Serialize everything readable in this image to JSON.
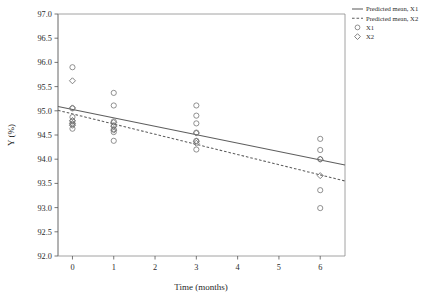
{
  "chart_data": {
    "type": "scatter",
    "title": "",
    "xlabel": "Time (months)",
    "ylabel": "Y (%)",
    "xlim": [
      -0.35,
      6.6
    ],
    "ylim": [
      92.0,
      97.0
    ],
    "grid": false,
    "xticks": [
      0,
      1,
      2,
      3,
      4,
      5,
      6
    ],
    "xtick_labels": [
      "0",
      "1",
      "2",
      "3",
      "4",
      "5",
      "6"
    ],
    "yticks": [
      92.0,
      92.5,
      93.0,
      93.5,
      94.0,
      94.5,
      95.0,
      95.5,
      96.0,
      96.5,
      97.0
    ],
    "ytick_labels": [
      "92.0",
      "92.5",
      "93.0",
      "93.5",
      "94.0",
      "94.5",
      "95.0",
      "95.5",
      "96.0",
      "96.5",
      "97.0"
    ],
    "legend_position": "outside-top-right",
    "legend": [
      {
        "key": "pred-mean-x1",
        "label": "Predicted mean, X1",
        "marker": "line-solid"
      },
      {
        "key": "pred-mean-x2",
        "label": "Predicted mean, X2",
        "marker": "line-dashed"
      },
      {
        "key": "obs-x1",
        "label": "X1",
        "marker": "circle"
      },
      {
        "key": "obs-x2",
        "label": "X2",
        "marker": "diamond"
      }
    ],
    "series": [
      {
        "name": "Predicted mean, X1",
        "type": "line",
        "style": "solid",
        "x": [
          -0.35,
          6.6
        ],
        "values": [
          95.09,
          93.88
        ]
      },
      {
        "name": "Predicted mean, X2",
        "type": "line",
        "style": "dashed",
        "x": [
          -0.35,
          6.6
        ],
        "values": [
          95.01,
          93.55
        ]
      },
      {
        "name": "X1",
        "type": "scatter",
        "marker": "circle",
        "points": [
          {
            "x": 0,
            "y": 95.9
          },
          {
            "x": 0,
            "y": 95.05
          },
          {
            "x": 0,
            "y": 94.87
          },
          {
            "x": 0,
            "y": 94.78
          },
          {
            "x": 0,
            "y": 94.72
          },
          {
            "x": 0,
            "y": 94.63
          },
          {
            "x": 1,
            "y": 95.37
          },
          {
            "x": 1,
            "y": 95.11
          },
          {
            "x": 1,
            "y": 94.78
          },
          {
            "x": 1,
            "y": 94.7
          },
          {
            "x": 1,
            "y": 94.62
          },
          {
            "x": 1,
            "y": 94.56
          },
          {
            "x": 1,
            "y": 94.38
          },
          {
            "x": 3,
            "y": 95.11
          },
          {
            "x": 3,
            "y": 94.9
          },
          {
            "x": 3,
            "y": 94.74
          },
          {
            "x": 3,
            "y": 94.55
          },
          {
            "x": 3,
            "y": 94.38
          },
          {
            "x": 3,
            "y": 94.2
          },
          {
            "x": 6,
            "y": 94.42
          },
          {
            "x": 6,
            "y": 94.19
          },
          {
            "x": 6,
            "y": 94.0
          },
          {
            "x": 6,
            "y": 93.36
          },
          {
            "x": 6,
            "y": 92.99
          }
        ]
      },
      {
        "name": "X2",
        "type": "scatter",
        "marker": "diamond",
        "points": [
          {
            "x": 0,
            "y": 95.62
          },
          {
            "x": 0,
            "y": 95.06
          },
          {
            "x": 0,
            "y": 94.8
          },
          {
            "x": 0,
            "y": 94.74
          },
          {
            "x": 0,
            "y": 94.7
          },
          {
            "x": 1,
            "y": 94.76
          },
          {
            "x": 1,
            "y": 94.68
          },
          {
            "x": 1,
            "y": 94.6
          },
          {
            "x": 3,
            "y": 94.54
          },
          {
            "x": 3,
            "y": 94.37
          },
          {
            "x": 3,
            "y": 94.33
          },
          {
            "x": 6,
            "y": 94.0
          },
          {
            "x": 6,
            "y": 93.66
          }
        ]
      }
    ]
  },
  "axes": {
    "x_title": "Time (months)",
    "y_title": "Y (%)"
  }
}
